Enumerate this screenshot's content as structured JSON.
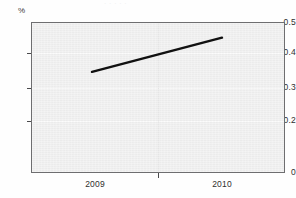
{
  "figure": {
    "title_remnant": "· · · · ·",
    "background_color": "#fefefe",
    "panel_color": "#f1f1f1",
    "frame_color": "#6e6e70"
  },
  "axes": {
    "y_unit_label": "%",
    "y_tick_labels": [
      "0.5",
      "0.4",
      "0.3",
      "0.2",
      "0"
    ],
    "x_tick_labels": [
      "2009",
      "2010"
    ]
  },
  "chart_data": {
    "type": "line",
    "title": "",
    "subtitle": "",
    "xlabel": "",
    "ylabel": "%",
    "x": [
      "2009",
      "2010"
    ],
    "categories": [
      "2009",
      "2010"
    ],
    "series": [
      {
        "name": "rate",
        "values": [
          0.335,
          0.448
        ],
        "color": "#111111",
        "line_width": 2.4,
        "markers": false
      }
    ],
    "values": [
      0.335,
      0.448
    ],
    "ylim": [
      0,
      0.5
    ],
    "yticks": [
      0,
      0.2,
      0.3,
      0.4,
      0.5
    ],
    "ytick_labels": [
      "0",
      "0.2",
      "0.3",
      "0.4",
      "0.5"
    ],
    "xticks": [
      "2009",
      "2010"
    ],
    "xlim": [
      "2008.5",
      "2010.6"
    ],
    "grid": true,
    "grid_color": "#fafafa",
    "grid_axis": "y",
    "legend": false,
    "legend_position": "none",
    "annotations": []
  }
}
